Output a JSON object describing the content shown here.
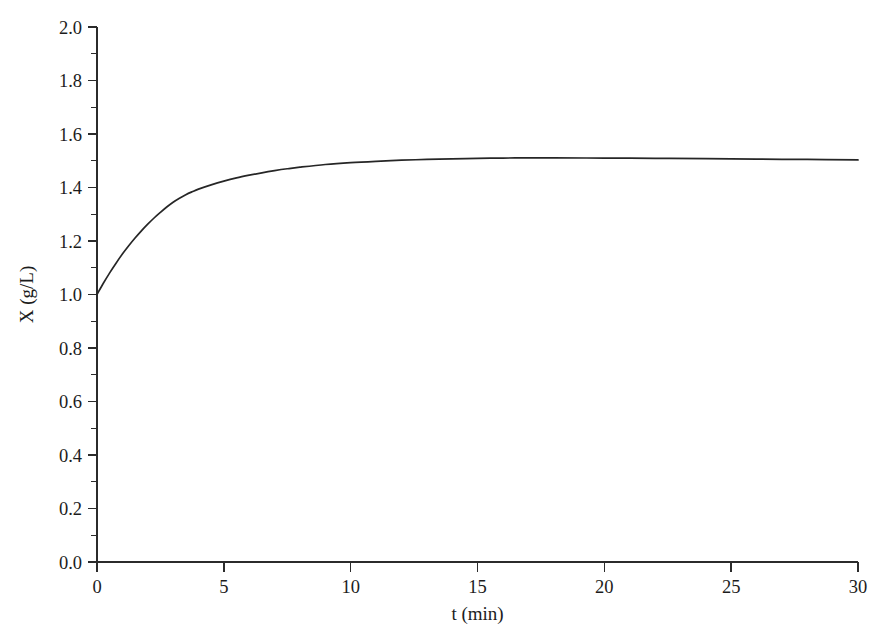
{
  "chart_data": {
    "type": "line",
    "title": "",
    "subtitle": "",
    "xlabel": "t (min)",
    "ylabel": "X (g/L)",
    "xlim": [
      0,
      30
    ],
    "ylim": [
      0.0,
      2.0
    ],
    "grid": false,
    "legend": null,
    "legend_position": "none",
    "background_color": "#ffffff",
    "line_color": "#262626",
    "axis_color": "#2b2b2b",
    "x_ticks": [
      0,
      5,
      10,
      15,
      20,
      25,
      30
    ],
    "x_tick_labels": [
      "0",
      "5",
      "10",
      "15",
      "20",
      "25",
      "30"
    ],
    "x_minor_ticks": [],
    "y_ticks": [
      0.0,
      0.2,
      0.4,
      0.6,
      0.8,
      1.0,
      1.2,
      1.4,
      1.6,
      1.8,
      2.0
    ],
    "y_tick_labels": [
      "0.0",
      "0.2",
      "0.4",
      "0.6",
      "0.8",
      "1.0",
      "1.2",
      "1.4",
      "1.6",
      "1.8",
      "2.0"
    ],
    "y_minor_ticks": [
      0.1,
      0.3,
      0.5,
      0.7,
      0.9,
      1.1,
      1.3,
      1.5,
      1.7,
      1.9
    ],
    "series": [
      {
        "name": "X",
        "x": [
          0,
          0.25,
          0.5,
          0.75,
          1.0,
          1.25,
          1.5,
          1.75,
          2.0,
          2.25,
          2.5,
          2.75,
          3.0,
          3.25,
          3.5,
          3.75,
          4.0,
          4.5,
          5.0,
          5.5,
          6.0,
          6.5,
          7.0,
          7.5,
          8.0,
          9.0,
          10.0,
          11.0,
          12.0,
          13.0,
          14.0,
          15.0,
          16.0,
          17.0,
          18.0,
          20.0,
          22.0,
          24.0,
          26.0,
          28.0,
          30.0
        ],
        "y": [
          1.0,
          1.042,
          1.081,
          1.117,
          1.151,
          1.182,
          1.211,
          1.238,
          1.263,
          1.286,
          1.307,
          1.327,
          1.345,
          1.36,
          1.373,
          1.384,
          1.394,
          1.41,
          1.424,
          1.436,
          1.446,
          1.455,
          1.463,
          1.47,
          1.476,
          1.486,
          1.493,
          1.498,
          1.502,
          1.505,
          1.507,
          1.509,
          1.51,
          1.511,
          1.511,
          1.51,
          1.509,
          1.508,
          1.506,
          1.505,
          1.503
        ]
      }
    ],
    "annotations": []
  },
  "figure": {
    "xlabel": "t (min)",
    "ylabel": "X (g/L)"
  }
}
